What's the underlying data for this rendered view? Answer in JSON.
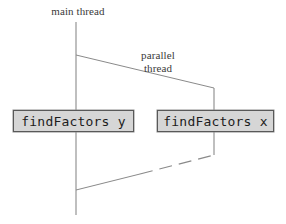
{
  "figure": {
    "type": "thread-fork-join-diagram",
    "background_color": "#ffffff",
    "line_color": "#808080",
    "label_color": "#3a3a3a",
    "box_fill_color": "#d6d6d6",
    "box_border_color": "#595959"
  },
  "labels": {
    "main_thread": "main thread",
    "parallel_thread_line1": "parallel",
    "parallel_thread_line2": "thread"
  },
  "boxes": [
    {
      "id": "find_factors_y",
      "text": "findFactors y"
    },
    {
      "id": "find_factors_x",
      "text": "findFactors x"
    }
  ],
  "geometry": {
    "main_thread_x": 76,
    "main_thread_top_y": 22,
    "main_thread_bottom_y": 215,
    "parallel_thread_x": 214,
    "parallel_thread_top_y": 88,
    "parallel_thread_bottom_y": 155,
    "fork_start": "76,55",
    "fork_end": "214,88",
    "join_start": "214,155",
    "join_end": "76,190"
  }
}
